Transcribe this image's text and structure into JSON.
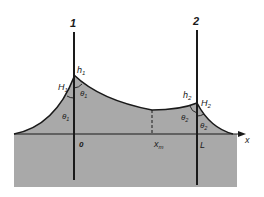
{
  "diagram": {
    "colors": {
      "liquid": "#a9a9a9",
      "line": "#1a1a1a",
      "background": "#ffffff"
    },
    "plates": [
      {
        "id": "1",
        "label": "1"
      },
      {
        "id": "2",
        "label": "2"
      }
    ],
    "labels": {
      "h1": "h",
      "h1_sub": "1",
      "H1": "H",
      "H1_sub": "1",
      "theta1_inner": "θ",
      "theta1_inner_sub": "1",
      "theta1_outer": "θ",
      "theta1_outer_sub": "1",
      "h2": "h",
      "h2_sub": "2",
      "H2": "H",
      "H2_sub": "2",
      "theta2_inner": "θ",
      "theta2_inner_sub": "2",
      "theta2_outer": "θ",
      "theta2_outer_sub": "2",
      "origin": "0",
      "xm": "x",
      "xm_sub": "m",
      "L": "L",
      "x_axis": "x"
    }
  }
}
